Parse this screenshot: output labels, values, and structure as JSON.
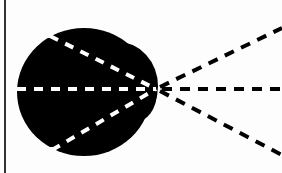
{
  "diagram": {
    "colors": {
      "background": "#fdfdfd",
      "blob": "#000000",
      "inner_dash": "#ffffff",
      "outer_dash": "#000000",
      "border": "#333333"
    },
    "focal_point": {
      "x": 156,
      "y": 89
    },
    "inner_rays": [
      {
        "from": {
          "x": 50,
          "y": 36
        },
        "to": {
          "x": 156,
          "y": 89
        }
      },
      {
        "from": {
          "x": 17,
          "y": 89
        },
        "to": {
          "x": 156,
          "y": 89
        }
      },
      {
        "from": {
          "x": 52,
          "y": 150
        },
        "to": {
          "x": 156,
          "y": 89
        }
      }
    ],
    "outer_rays": [
      {
        "from": {
          "x": 156,
          "y": 89
        },
        "to": {
          "x": 282,
          "y": 28
        }
      },
      {
        "from": {
          "x": 156,
          "y": 89
        },
        "to": {
          "x": 282,
          "y": 89
        }
      },
      {
        "from": {
          "x": 156,
          "y": 89
        },
        "to": {
          "x": 282,
          "y": 155
        }
      }
    ]
  }
}
